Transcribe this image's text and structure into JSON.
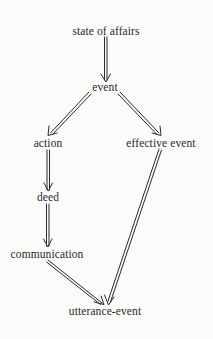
{
  "diagram": {
    "type": "directed-graph",
    "nodes": [
      {
        "id": "state_of_affairs",
        "label": "state of affairs",
        "x": 106,
        "y": 26
      },
      {
        "id": "event",
        "label": "event",
        "x": 105,
        "y": 82
      },
      {
        "id": "action",
        "label": "action",
        "x": 48,
        "y": 138
      },
      {
        "id": "effective_event",
        "label": "effective event",
        "x": 161,
        "y": 138
      },
      {
        "id": "deed",
        "label": "deed",
        "x": 48,
        "y": 192
      },
      {
        "id": "communication",
        "label": "communication",
        "x": 47,
        "y": 249
      },
      {
        "id": "utterance_event",
        "label": "utterance-event",
        "x": 105,
        "y": 306
      }
    ],
    "edges": [
      {
        "from": "state_of_affairs",
        "to": "event"
      },
      {
        "from": "event",
        "to": "action"
      },
      {
        "from": "event",
        "to": "effective_event"
      },
      {
        "from": "action",
        "to": "deed"
      },
      {
        "from": "deed",
        "to": "communication"
      },
      {
        "from": "communication",
        "to": "utterance_event"
      },
      {
        "from": "effective_event",
        "to": "utterance_event"
      }
    ],
    "colors": {
      "line": "#2b2b2b",
      "background": "#fbfbf9"
    }
  }
}
